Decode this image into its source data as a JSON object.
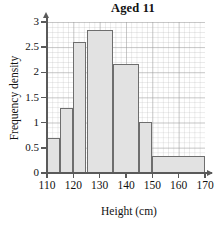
{
  "chart_data": {
    "type": "bar",
    "title": "Aged 11",
    "xlabel": "Height (cm)",
    "ylabel": "Frequency density",
    "xlim": [
      110,
      170
    ],
    "ylim": [
      0,
      3
    ],
    "grid": true,
    "legend": "none",
    "xticks": [
      110,
      120,
      130,
      140,
      150,
      160,
      170
    ],
    "xtick_labels": [
      "110",
      "120",
      "130",
      "140",
      "150",
      "160",
      "170"
    ],
    "yticks": [
      0,
      0.5,
      1,
      1.5,
      2,
      2.5,
      3
    ],
    "ytick_labels": [
      "0",
      "0.5",
      "1",
      "1.5",
      "2",
      "2.5",
      "3"
    ],
    "bars": [
      {
        "label": "110-115",
        "x0": 110,
        "x1": 115,
        "value": 0.7
      },
      {
        "label": "115-120",
        "x0": 115,
        "x1": 120,
        "value": 1.3
      },
      {
        "label": "120-125",
        "x0": 120,
        "x1": 125,
        "value": 2.6
      },
      {
        "label": "125-135",
        "x0": 125,
        "x1": 135,
        "value": 2.85
      },
      {
        "label": "135-145",
        "x0": 135,
        "x1": 145,
        "value": 2.17
      },
      {
        "label": "145-150",
        "x0": 145,
        "x1": 150,
        "value": 1.02
      },
      {
        "label": "150-170",
        "x0": 150,
        "x1": 170,
        "value": 0.33
      }
    ],
    "bar_fill": "#e2e2e2",
    "bar_stroke": "#6e6e6e",
    "axis_color": "#5a5a5a",
    "grid_color": "#c0c0c0"
  }
}
